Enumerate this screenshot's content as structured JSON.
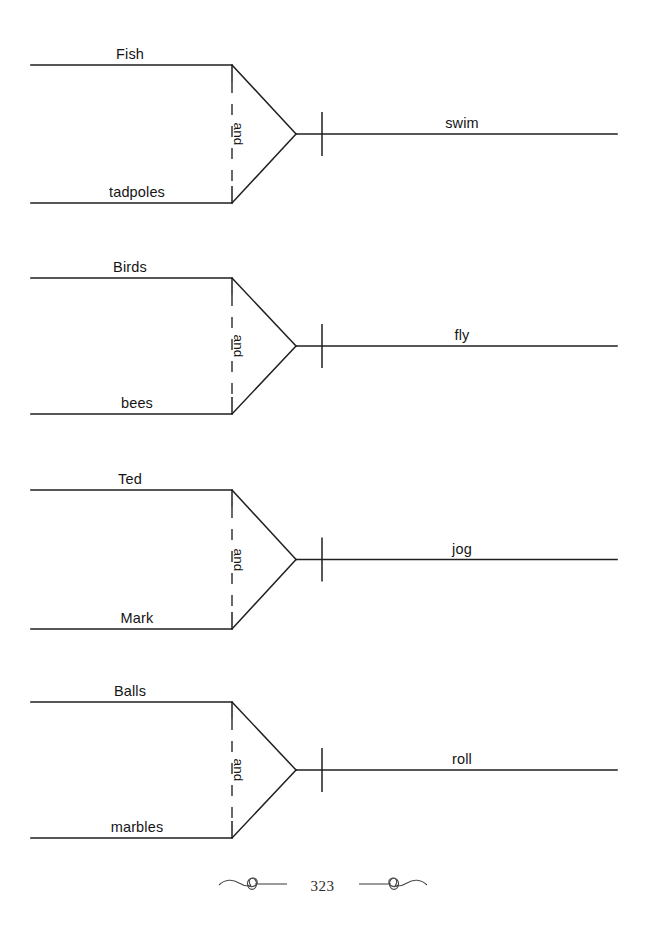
{
  "page": {
    "background_color": "#ffffff",
    "ink_color": "#1f1f1f",
    "width": 645,
    "height": 936
  },
  "diagrams": [
    {
      "id": "diagram-1",
      "subject_top": "Fish",
      "subject_bottom": "tadpoles",
      "conjunction": "and",
      "verb": "swim",
      "sentence": "Fish and tadpoles swim"
    },
    {
      "id": "diagram-2",
      "subject_top": "Birds",
      "subject_bottom": "bees",
      "conjunction": "and",
      "verb": "fly",
      "sentence": "Birds and bees fly"
    },
    {
      "id": "diagram-3",
      "subject_top": "Ted",
      "subject_bottom": "Mark",
      "conjunction": "and",
      "verb": "jog",
      "sentence": "Ted and Mark jog"
    },
    {
      "id": "diagram-4",
      "subject_top": "Balls",
      "subject_bottom": "marbles",
      "conjunction": "and",
      "verb": "roll",
      "sentence": "Balls and marbles roll"
    }
  ],
  "footer": {
    "page_number": "323",
    "left_ornament": "flourish-ornament-left",
    "right_ornament": "flourish-ornament-right"
  }
}
